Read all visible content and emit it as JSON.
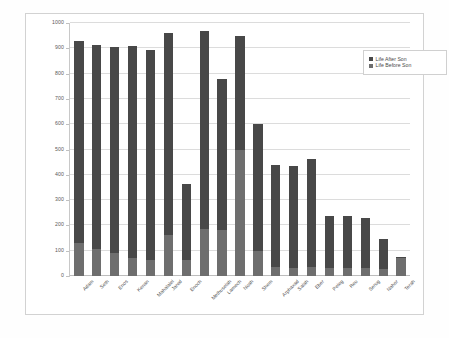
{
  "chart_data": {
    "type": "bar",
    "subtype": "stacked-column",
    "title": "",
    "xlabel": "",
    "ylabel": "",
    "ylim": [
      0,
      1000
    ],
    "ytick_step": 100,
    "yticks": [
      0,
      100,
      200,
      300,
      400,
      500,
      600,
      700,
      800,
      900,
      1000
    ],
    "ytick_labels": [
      "0",
      "100",
      "200",
      "300",
      "400",
      "500",
      "600",
      "700",
      "800",
      "900",
      "1000"
    ],
    "grid": true,
    "legend_position": "top-right",
    "categories": [
      "Adam",
      "Seth",
      "Enos",
      "Kenan",
      "Mahalalel",
      "Jared",
      "Enoch",
      "Methuselah",
      "Lamech",
      "Noah",
      "Shem",
      "Arphaxad",
      "Salah",
      "Eber",
      "Peleg",
      "Reu",
      "Serug",
      "Nahor",
      "Terah"
    ],
    "series": [
      {
        "name": "Life Before Son",
        "color": "#6e6e6e",
        "values": [
          130,
          105,
          90,
          70,
          65,
          162,
          65,
          187,
          182,
          500,
          100,
          35,
          30,
          34,
          30,
          32,
          30,
          29,
          70
        ]
      },
      {
        "name": "Life After Son",
        "color": "#484848",
        "values": [
          800,
          807,
          815,
          840,
          830,
          800,
          300,
          782,
          595,
          450,
          500,
          403,
          403,
          430,
          209,
          207,
          200,
          119,
          5
        ]
      }
    ],
    "totals": [
      930,
      912,
      905,
      910,
      895,
      962,
      365,
      969,
      777,
      950,
      600,
      438,
      433,
      464,
      239,
      239,
      230,
      148,
      75
    ]
  },
  "legend": {
    "entries": [
      {
        "label": "Life After Son",
        "color": "#484848"
      },
      {
        "label": "Life Before Son",
        "color": "#6e6e6e"
      }
    ]
  }
}
